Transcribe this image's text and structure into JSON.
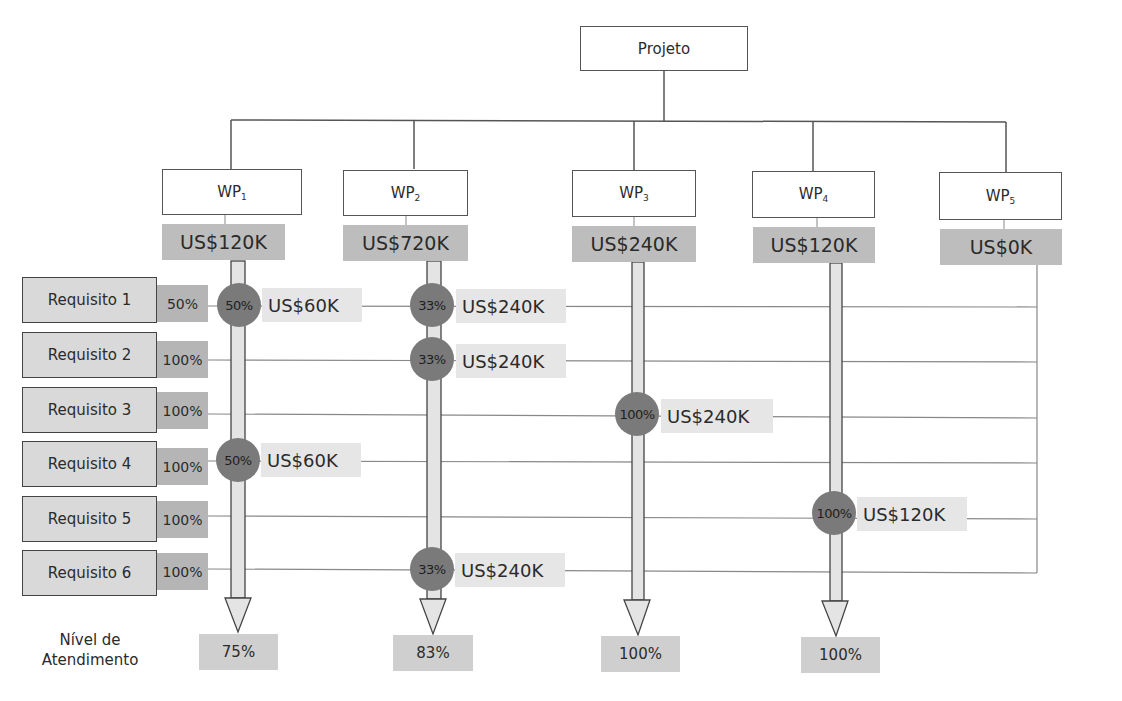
{
  "project": {
    "label": "Projeto"
  },
  "work_packages": [
    {
      "name": "WP",
      "sub": "1",
      "cost": "US$120K",
      "result": "75%"
    },
    {
      "name": "WP",
      "sub": "2",
      "cost": "US$720K",
      "result": "83%"
    },
    {
      "name": "WP",
      "sub": "3",
      "cost": "US$240K",
      "result": "100%"
    },
    {
      "name": "WP",
      "sub": "4",
      "cost": "US$120K",
      "result": "100%"
    },
    {
      "name": "WP",
      "sub": "5",
      "cost": "US$0K",
      "result": ""
    }
  ],
  "requirements": [
    {
      "label": "Requisito 1",
      "pct": "50%"
    },
    {
      "label": "Requisito 2",
      "pct": "100%"
    },
    {
      "label": "Requisito 3",
      "pct": "100%"
    },
    {
      "label": "Requisito 4",
      "pct": "100%"
    },
    {
      "label": "Requisito 5",
      "pct": "100%"
    },
    {
      "label": "Requisito 6",
      "pct": "100%"
    }
  ],
  "allocations": [
    {
      "wp": 1,
      "req": 1,
      "pct": "50%",
      "amount": "US$60K"
    },
    {
      "wp": 1,
      "req": 4,
      "pct": "50%",
      "amount": "US$60K"
    },
    {
      "wp": 2,
      "req": 1,
      "pct": "33%",
      "amount": "US$240K"
    },
    {
      "wp": 2,
      "req": 2,
      "pct": "33%",
      "amount": "US$240K"
    },
    {
      "wp": 2,
      "req": 6,
      "pct": "33%",
      "amount": "US$240K"
    },
    {
      "wp": 3,
      "req": 3,
      "pct": "100%",
      "amount": "US$240K"
    },
    {
      "wp": 4,
      "req": 5,
      "pct": "100%",
      "amount": "US$120K"
    }
  ],
  "footer": {
    "label_line1": "Nível de",
    "label_line2": "Atendimento"
  },
  "colors": {
    "cost_fill": "#bdbdbd",
    "circle_fill": "#7a7a7a",
    "requirement_fill": "#d9d9d9",
    "allocation_fill": "#e6e6e6",
    "result_fill": "#cfcfcf",
    "line": "#777777"
  }
}
